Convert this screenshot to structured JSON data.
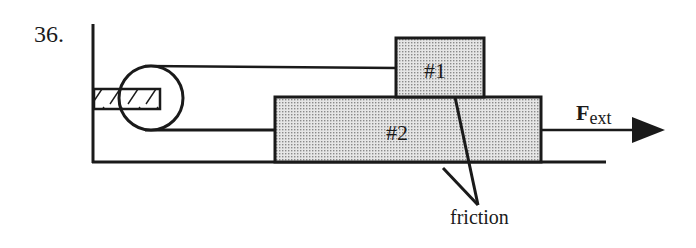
{
  "problem_number": "36.",
  "blocks": [
    {
      "label": "#1"
    },
    {
      "label": "#2"
    }
  ],
  "force": {
    "symbol": "F",
    "subscript": "ext"
  },
  "annotation": {
    "label": "friction"
  },
  "colors": {
    "ink": "#1a1a1a",
    "block_fill": "#d4d4d4",
    "background": "#ffffff"
  }
}
